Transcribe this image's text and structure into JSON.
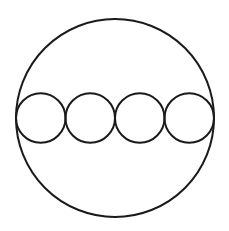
{
  "diagram": {
    "stroke_color": "#1a1a1a",
    "background": "#ffffff",
    "outer_circle": {
      "cx": 115,
      "cy": 118,
      "r": 99
    },
    "inner_circles": [
      {
        "cx": 40.75,
        "cy": 118,
        "r": 24.75
      },
      {
        "cx": 90.25,
        "cy": 118,
        "r": 24.75
      },
      {
        "cx": 139.75,
        "cy": 118,
        "r": 24.75
      },
      {
        "cx": 189.25,
        "cy": 118,
        "r": 24.75
      }
    ]
  }
}
